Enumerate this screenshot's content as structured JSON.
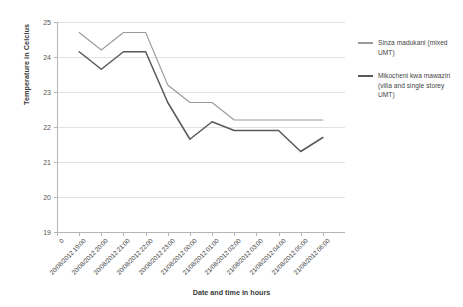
{
  "chart_data": {
    "type": "line",
    "title": "",
    "xlabel": "Date and time in hours",
    "ylabel": "Temperature in Celcius",
    "ylim": [
      19,
      25
    ],
    "ytick_step": 1,
    "yticks": [
      25,
      24,
      23,
      22,
      21,
      20,
      19
    ],
    "grid": true,
    "legend_position": "right",
    "x_origin_label": "0",
    "categories": [
      "20/08/2012 19:00",
      "20/08/2012 20:00",
      "20/08/2012 21:00",
      "20/08/2012 22:00",
      "20/08/2012 23:00",
      "21/08/2012 00:00",
      "21/08/2012 01:00",
      "21/08/2012 02:00",
      "21/08/2012 03:00",
      "21/08/2012 04:00",
      "21/08/2012 05:00",
      "21/08/2012 06:00"
    ],
    "series": [
      {
        "name": "Sinza madukani (mixed UMT)",
        "color": "#9a9a9a",
        "values": [
          24.7,
          24.2,
          24.7,
          24.7,
          23.2,
          22.7,
          22.7,
          22.2,
          22.2,
          22.2,
          22.2,
          22.2
        ]
      },
      {
        "name": "Mikocheni kwa mawaziri (villa and single storey UMT)",
        "color": "#595959",
        "values": [
          24.15,
          23.65,
          24.15,
          24.15,
          22.7,
          21.65,
          22.15,
          21.9,
          21.9,
          21.9,
          21.3,
          21.7
        ]
      }
    ]
  },
  "legend": {
    "items": [
      {
        "label": "Sinza madukani (mixed UMT)"
      },
      {
        "label": "Mikocheni kwa mawaziri (villa and single storey UMT)"
      }
    ]
  },
  "axes": {
    "y_title": "Temperature in Celcius",
    "x_title": "Date and time in hours"
  }
}
